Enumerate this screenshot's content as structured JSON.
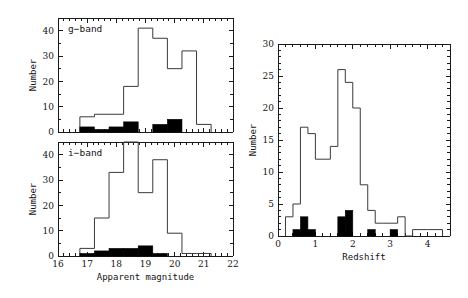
{
  "figure": {
    "panels": [
      {
        "id": "g-band",
        "label": "g−band",
        "xlabel": "",
        "ylabel": "Number"
      },
      {
        "id": "i-band",
        "label": "i−band",
        "xlabel": "Apparent magnitude",
        "ylabel": "Number"
      },
      {
        "id": "redshift",
        "label": "",
        "xlabel": "Redshift",
        "ylabel": "Number"
      }
    ]
  },
  "chart_data": [
    {
      "type": "bar",
      "id": "g-band",
      "title": "g−band",
      "xlabel": "Apparent magnitude",
      "ylabel": "Number",
      "xlim": [
        16,
        22
      ],
      "ylim": [
        0,
        45
      ],
      "xticks": [
        16,
        17,
        18,
        19,
        20,
        21,
        22
      ],
      "yticks": [
        0,
        10,
        20,
        30,
        40
      ],
      "bin_width": 0.5,
      "bin_edges": [
        16.75,
        17.25,
        17.75,
        18.25,
        18.75,
        19.25,
        19.75,
        20.25,
        20.75,
        21.25
      ],
      "series": [
        {
          "name": "all",
          "style": "outline",
          "values": [
            6,
            7,
            7,
            18,
            41,
            37,
            25,
            32,
            3
          ]
        },
        {
          "name": "detected",
          "style": "filled",
          "values": [
            2,
            1,
            2,
            4,
            0,
            3,
            5,
            0,
            0
          ]
        }
      ],
      "grid": false,
      "legend": "none"
    },
    {
      "type": "bar",
      "id": "i-band",
      "title": "i−band",
      "xlabel": "Apparent magnitude",
      "ylabel": "Number",
      "xlim": [
        16,
        22
      ],
      "ylim": [
        0,
        45
      ],
      "xticks": [
        16,
        17,
        18,
        19,
        20,
        21,
        22
      ],
      "yticks": [
        0,
        10,
        20,
        30,
        40
      ],
      "bin_width": 0.5,
      "bin_edges": [
        16.75,
        17.25,
        17.75,
        18.25,
        18.75,
        19.25,
        19.75,
        20.25,
        20.75,
        21.25
      ],
      "series": [
        {
          "name": "all",
          "style": "outline",
          "values": [
            3,
            15,
            33,
            45,
            25,
            38,
            9,
            1,
            1
          ]
        },
        {
          "name": "detected",
          "style": "filled",
          "values": [
            1,
            2,
            3,
            3,
            4,
            1,
            0,
            0,
            0
          ]
        }
      ],
      "grid": false,
      "legend": "none"
    },
    {
      "type": "bar",
      "id": "redshift",
      "title": "",
      "xlabel": "Redshift",
      "ylabel": "Number",
      "xlim": [
        0,
        4.6
      ],
      "ylim": [
        0,
        30
      ],
      "xticks": [
        0,
        1,
        2,
        3,
        4
      ],
      "yticks": [
        0,
        5,
        10,
        15,
        20,
        25,
        30
      ],
      "bin_width": 0.2,
      "bin_edges": [
        0.2,
        0.4,
        0.6,
        0.8,
        1.0,
        1.2,
        1.4,
        1.6,
        1.8,
        2.0,
        2.2,
        2.4,
        2.6,
        2.8,
        3.0,
        3.2,
        3.4,
        3.6,
        3.8,
        4.0,
        4.2,
        4.4
      ],
      "series": [
        {
          "name": "all",
          "style": "outline",
          "values": [
            3,
            5,
            17,
            16,
            12,
            12,
            14,
            26,
            24,
            20,
            8,
            4,
            2,
            2,
            2,
            3,
            0,
            1,
            1,
            1,
            1
          ]
        },
        {
          "name": "detected",
          "style": "filled",
          "values": [
            0,
            1,
            3,
            1,
            0,
            0,
            0,
            3,
            4,
            0,
            0,
            1,
            0,
            0,
            1,
            0,
            0,
            0,
            0,
            0,
            0
          ]
        }
      ],
      "grid": false,
      "legend": "none"
    }
  ]
}
